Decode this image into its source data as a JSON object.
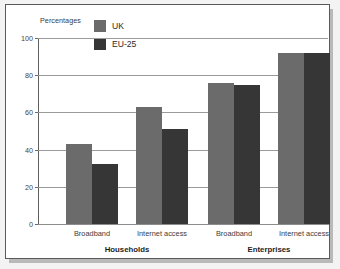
{
  "chart_data": {
    "type": "bar",
    "title": "",
    "subtitle": "",
    "ylabel": "Percentages",
    "xlabel": "",
    "ylim": [
      0,
      100
    ],
    "yticks": [
      0,
      20,
      40,
      60,
      80,
      100
    ],
    "ytick_labels": [
      "0",
      "20",
      "40",
      "60",
      "80",
      "100"
    ],
    "grid": "horizontal",
    "legend_position": "top-center",
    "categories": [
      "Broadband",
      "Internet access",
      "Broadband",
      "Internet access"
    ],
    "group_labels": [
      "Households",
      "Enterprises"
    ],
    "groups": [
      {
        "name": "Households",
        "categories": [
          "Broadband",
          "Internet access"
        ]
      },
      {
        "name": "Enterprises",
        "categories": [
          "Broadband",
          "Internet access"
        ]
      }
    ],
    "series": [
      {
        "name": "UK",
        "color": "#6b6b6b",
        "values": [
          43,
          63,
          76,
          92
        ]
      },
      {
        "name": "EU-25",
        "color": "#363636",
        "values": [
          32,
          51,
          75,
          92
        ]
      }
    ],
    "points": [
      {
        "group": "Households",
        "category": "Broadband",
        "series": "UK",
        "value": 43
      },
      {
        "group": "Households",
        "category": "Broadband",
        "series": "EU-25",
        "value": 32
      },
      {
        "group": "Households",
        "category": "Internet access",
        "series": "UK",
        "value": 63
      },
      {
        "group": "Households",
        "category": "Internet access",
        "series": "EU-25",
        "value": 51
      },
      {
        "group": "Enterprises",
        "category": "Broadband",
        "series": "UK",
        "value": 76
      },
      {
        "group": "Enterprises",
        "category": "Broadband",
        "series": "EU-25",
        "value": 75
      },
      {
        "group": "Enterprises",
        "category": "Internet access",
        "series": "UK",
        "value": 92
      },
      {
        "group": "Enterprises",
        "category": "Internet access",
        "series": "EU-25",
        "value": 92
      }
    ]
  },
  "legend": {
    "items": [
      {
        "label": "UK",
        "color": "#6b6b6b"
      },
      {
        "label": "EU-25",
        "color": "#363636"
      }
    ]
  },
  "axis": {
    "title": "Percentages",
    "tick_0": "0",
    "tick_20": "20",
    "tick_40": "40",
    "tick_60": "60",
    "tick_80": "80",
    "tick_100": "100"
  },
  "labels": {
    "cat_0": "Broadband",
    "cat_1": "Internet access",
    "cat_2": "Broadband",
    "cat_3": "Internet access",
    "group_0": "Households",
    "group_1": "Enterprises"
  },
  "colors": {
    "uk": "#6b6b6b",
    "eu25": "#363636",
    "gridline": "#9b9b9b",
    "panel_border": "#5a5a5a",
    "background": "#ffffff",
    "page": "#f3f3f3"
  }
}
